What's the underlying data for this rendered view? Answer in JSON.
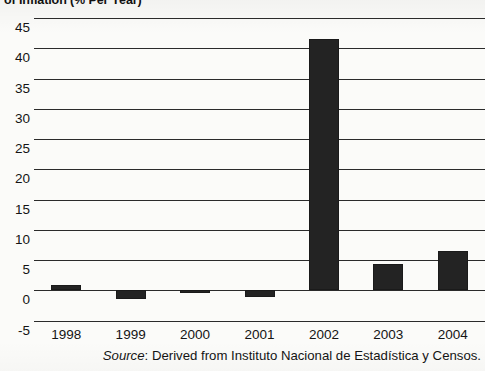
{
  "chart_data": {
    "type": "bar",
    "title": "of Inflation (% Per Year)",
    "title_note": "Title is cropped at the top edge of the screenshot; only the lower half of the glyphs is visible.",
    "xlabel": "",
    "ylabel": "",
    "categories": [
      "1998",
      "1999",
      "2000",
      "2001",
      "2002",
      "2003",
      "2004"
    ],
    "values": [
      0.9,
      -1.4,
      -0.4,
      -1.1,
      41.5,
      4.3,
      6.5
    ],
    "series": [
      {
        "name": "Rate of Inflation",
        "values": [
          0.9,
          -1.4,
          -0.4,
          -1.1,
          41.5,
          4.3,
          6.5
        ]
      }
    ],
    "ylim": [
      -5,
      45
    ],
    "ytick_values": [
      45,
      40,
      35,
      30,
      25,
      20,
      15,
      10,
      5,
      0,
      -5
    ],
    "ytick_labels": [
      "45",
      "40",
      "35",
      "30",
      "25",
      "20",
      "15",
      "10",
      "5",
      "0",
      "-5"
    ],
    "grid": true,
    "grid_axis": "y",
    "legend": null,
    "legend_position": "none",
    "bar_color": "#232323",
    "background_color": "#fbfbf9",
    "axis_color": "#2b2b2b"
  },
  "source": {
    "label": "Source",
    "separator": ": ",
    "text": "Derived from Instituto Nacional de Estadística y Censos."
  }
}
